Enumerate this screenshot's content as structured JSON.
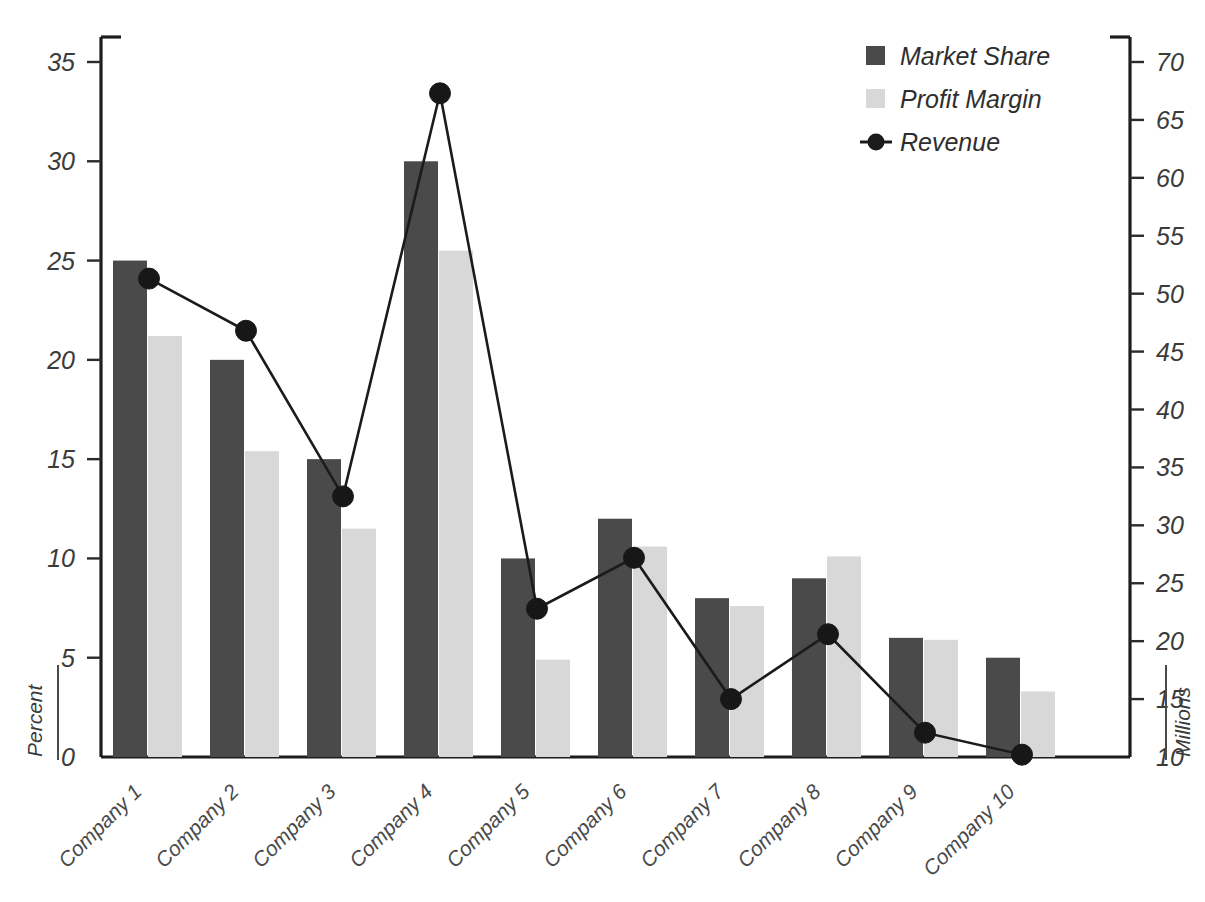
{
  "chart_data": {
    "type": "bar",
    "title": "",
    "categories": [
      "Company 1",
      "Company 2",
      "Company 3",
      "Company 4",
      "Company 5",
      "Company 6",
      "Company 7",
      "Company 8",
      "Company 9",
      "Company 10"
    ],
    "series": [
      {
        "name": "Market Share",
        "type": "bar",
        "axis": "left",
        "color": "#4a4a4a",
        "values": [
          25.0,
          20.0,
          15.0,
          30.0,
          10.0,
          12.0,
          8.0,
          9.0,
          6.0,
          5.0
        ]
      },
      {
        "name": "Profit Margin",
        "type": "bar",
        "axis": "left",
        "color": "#d8d8d8",
        "values": [
          21.2,
          15.4,
          11.5,
          25.5,
          4.9,
          10.6,
          7.6,
          10.1,
          5.9,
          3.3
        ]
      },
      {
        "name": "Revenue",
        "type": "line",
        "axis": "right",
        "color": "#1b1b1b",
        "values": [
          51.3,
          46.8,
          32.5,
          67.3,
          22.8,
          27.2,
          15.0,
          20.6,
          12.1,
          10.2
        ]
      }
    ],
    "left_axis": {
      "label": "Percent",
      "min": 0,
      "max": 35,
      "step": 5,
      "ticks": [
        "0",
        "5",
        "10",
        "15",
        "20",
        "25",
        "30",
        "35"
      ]
    },
    "right_axis": {
      "label": "Millions",
      "min": 10,
      "max": 70,
      "step": 5,
      "ticks": [
        "10",
        "15",
        "20",
        "25",
        "30",
        "35",
        "40",
        "45",
        "50",
        "55",
        "60",
        "65",
        "70"
      ]
    },
    "xlabel": "",
    "grid": false,
    "legend_position": "top-right",
    "legend": [
      {
        "label": "Market Share",
        "marker": "square",
        "color": "#4a4a4a"
      },
      {
        "label": "Profit Margin",
        "marker": "square",
        "color": "#d8d8d8"
      },
      {
        "label": "Revenue",
        "marker": "line-dot",
        "color": "#1b1b1b"
      }
    ]
  },
  "legend": {
    "items": [
      {
        "label": "Market Share"
      },
      {
        "label": "Profit Margin"
      },
      {
        "label": "Revenue"
      }
    ]
  },
  "axes": {
    "left_title": "Percent",
    "right_title": "Millions",
    "left_ticks": [
      "35",
      "30",
      "25",
      "20",
      "15",
      "10",
      "5",
      "0"
    ],
    "right_ticks": [
      "70",
      "65",
      "60",
      "55",
      "50",
      "45",
      "40",
      "35",
      "30",
      "25",
      "20",
      "15",
      "10"
    ]
  },
  "x_categories": [
    "Company 1",
    "Company 2",
    "Company 3",
    "Company 4",
    "Company 5",
    "Company 6",
    "Company 7",
    "Company 8",
    "Company 9",
    "Company 10"
  ]
}
